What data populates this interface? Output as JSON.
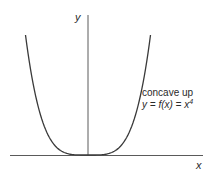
{
  "chart_data": {
    "type": "line",
    "title": "",
    "xlabel": "x",
    "ylabel": "y",
    "function": "y = f(x) = x^4",
    "annotation": {
      "line1": "concave up",
      "line2_prefix": "y = f(x) = x",
      "line2_exponent": "4"
    },
    "series": [
      {
        "name": "y = x^4",
        "x": [
          -1.0,
          -0.8,
          -0.6,
          -0.4,
          -0.2,
          0.0,
          0.2,
          0.4,
          0.6,
          0.8,
          1.0
        ],
        "values": [
          1.0,
          0.4096,
          0.1296,
          0.0256,
          0.0016,
          0.0,
          0.0016,
          0.0256,
          0.1296,
          0.4096,
          1.0
        ]
      }
    ],
    "xlim": [
      -1.3,
      1.85
    ],
    "ylim": [
      0,
      1.0
    ],
    "grid": false,
    "ticks": false,
    "legend": null,
    "colors": {
      "curve": "#3a3a3a",
      "axes": "#555555",
      "text": "#2a2a2a"
    }
  },
  "labels": {
    "x_axis": "x",
    "y_axis": "y",
    "concave": "concave up",
    "eq_prefix": "y = f(x) = x",
    "eq_exp": "4"
  }
}
